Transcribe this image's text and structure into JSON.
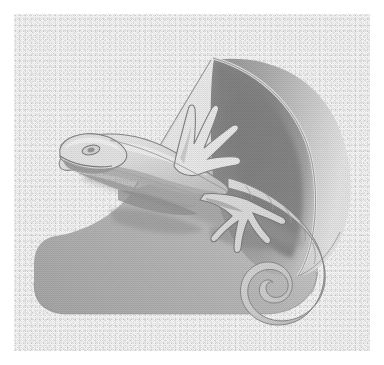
{
  "image": {
    "title": "Lizard Draped Over a Cone",
    "subject": "lizard-on-cone",
    "style": "halftone dithered grayscale line illustration",
    "medium": "grayscale engraving / stipple print",
    "background_label": "noisy textured paper",
    "border_label": "white margin",
    "width": 384,
    "height": 365
  },
  "palette": {
    "paper": "#fbfbfb",
    "paper_noise": "#e9e9e9",
    "margin": "#ffffff",
    "cone_outer_light": "#e6e6e6",
    "cone_outer_mid": "#b4b4b4",
    "cone_outer_dark": "#9b9b9b",
    "cone_interior_dark": "#8a8a8a",
    "cone_interior_mid": "#a8a8a8",
    "cone_interior_light": "#d6d6d6",
    "cone_rim_light": "#efefef",
    "lizard_body_light": "#ececec",
    "lizard_body_mid": "#cfcfcf",
    "lizard_shadow": "#9f9f9f",
    "outline": "#7d7d7d",
    "outline_soft": "#a4a4a4",
    "highlight": "#f7f7f7"
  },
  "objects": [
    {
      "name": "cone",
      "label": "Cone / horn form",
      "description": "Large cone opening toward upper right, apex at lower left, with a dark shaded interior bowl and a broad light outer surface."
    },
    {
      "name": "cone-interior",
      "label": "Cone interior",
      "description": "Elliptical concave interior shaded from dark grey at the upper-left throat to lighter grey along the right rim."
    },
    {
      "name": "cone-rim",
      "label": "Cone rim",
      "description": "Curved highlighted lip running from the apex around the right side down to the lower right."
    },
    {
      "name": "lizard",
      "label": "Lizard",
      "description": "Pale grey lizard lying diagonally across the cone, head at upper left, long tail spiralling into a coil at lower right."
    },
    {
      "name": "lizard-head",
      "label": "Lizard head",
      "description": "Tapered snout pointing left with a single almond-shaped eye and a dark mouth line."
    },
    {
      "name": "lizard-eye",
      "label": "Lizard eye",
      "description": "Small almond outline with a darker pupil on the upper side of the head."
    },
    {
      "name": "lizard-front-leg",
      "label": "Front leg",
      "description": "Raised foreleg with five splayed pointed toes reaching up toward the cone's inner wall."
    },
    {
      "name": "lizard-hind-leg",
      "label": "Hind leg",
      "description": "Lower leg with five long spreading toes resting against the cone surface, casting a grey shadow."
    },
    {
      "name": "lizard-tail",
      "label": "Tail",
      "description": "Long tapering banded tail that sweeps right and curls into a tight spiral."
    },
    {
      "name": "tail-spiral",
      "label": "Tail spiral",
      "description": "Tight inward coil at the tail tip, about one and a half turns."
    },
    {
      "name": "cast-shadow",
      "label": "Cast shadow",
      "description": "Soft grey shadow of the lizard falling across the cone's outer surface."
    }
  ]
}
